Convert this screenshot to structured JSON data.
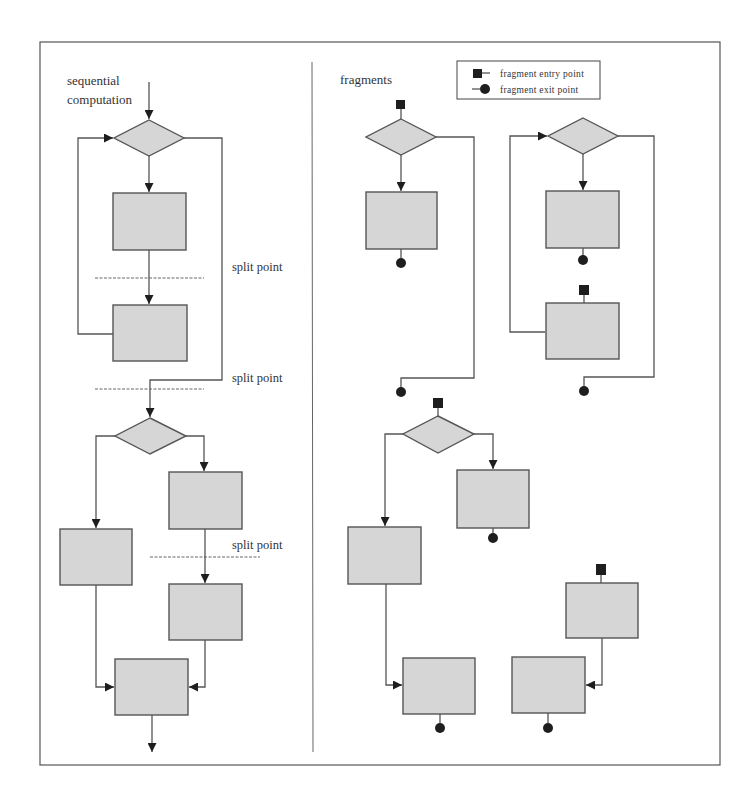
{
  "diagram": {
    "title_left": [
      "sequential",
      "computation"
    ],
    "title_right": "fragments",
    "split_label": "split point",
    "legend": {
      "entry": "fragment entry point",
      "exit": "fragment exit point"
    },
    "colors": {
      "shape_fill": "#d6d6d6",
      "stroke": "#555555",
      "marker": "#1e1e1e",
      "text": "#333333"
    },
    "split_points": [
      {
        "label": "split point"
      },
      {
        "label": "split point"
      },
      {
        "label": "split point"
      }
    ]
  }
}
